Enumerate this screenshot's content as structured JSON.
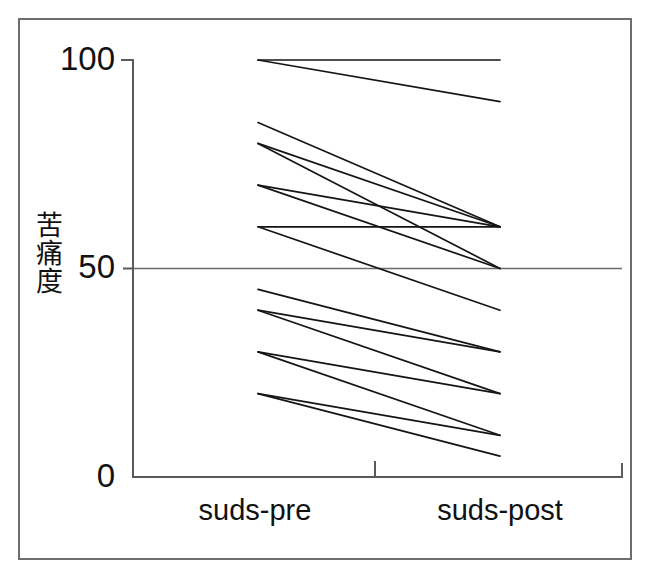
{
  "figure": {
    "background_color": "#ffffff",
    "frame_color": "#6e6e6e",
    "line_color": "#151515",
    "axis_color": "#5a5a5a"
  },
  "axes": {
    "ylabel_text": "苦痛度",
    "y_ticks": [
      {
        "value": 100,
        "label": "100"
      },
      {
        "value": 50,
        "label": "50"
      },
      {
        "value": 0,
        "label": "0"
      }
    ],
    "x_categories": [
      {
        "key": "pre",
        "label": "suds-pre"
      },
      {
        "key": "post",
        "label": "suds-post"
      }
    ]
  },
  "chart_data": {
    "type": "line",
    "title": "",
    "subtitle": "",
    "xlabel": "",
    "ylabel": "苦痛度",
    "categories": [
      "suds-pre",
      "suds-post"
    ],
    "x": [
      0,
      1
    ],
    "ylim": [
      0,
      100
    ],
    "xlim": [
      -0.12,
      1.12
    ],
    "grid": true,
    "gridlines_y": [
      50
    ],
    "legend": false,
    "legend_position": "none",
    "y_tick_values": [
      0,
      50,
      100
    ],
    "y_tick_labels": [
      "0",
      "50",
      "100"
    ],
    "annotations": [],
    "series": [
      {
        "name": "subject-1",
        "values": [
          100,
          100
        ]
      },
      {
        "name": "subject-2",
        "values": [
          100,
          90
        ]
      },
      {
        "name": "subject-3",
        "values": [
          85,
          60
        ]
      },
      {
        "name": "subject-4",
        "values": [
          80,
          60
        ]
      },
      {
        "name": "subject-5",
        "values": [
          80,
          50
        ]
      },
      {
        "name": "subject-6",
        "values": [
          70,
          60
        ]
      },
      {
        "name": "subject-7",
        "values": [
          70,
          50
        ]
      },
      {
        "name": "subject-8",
        "values": [
          60,
          60
        ]
      },
      {
        "name": "subject-9",
        "values": [
          60,
          40
        ]
      },
      {
        "name": "subject-10",
        "values": [
          45,
          30
        ]
      },
      {
        "name": "subject-11",
        "values": [
          40,
          30
        ]
      },
      {
        "name": "subject-12",
        "values": [
          40,
          20
        ]
      },
      {
        "name": "subject-13",
        "values": [
          30,
          20
        ]
      },
      {
        "name": "subject-14",
        "values": [
          30,
          10
        ]
      },
      {
        "name": "subject-15",
        "values": [
          20,
          10
        ]
      },
      {
        "name": "subject-16",
        "values": [
          20,
          5
        ]
      }
    ]
  }
}
